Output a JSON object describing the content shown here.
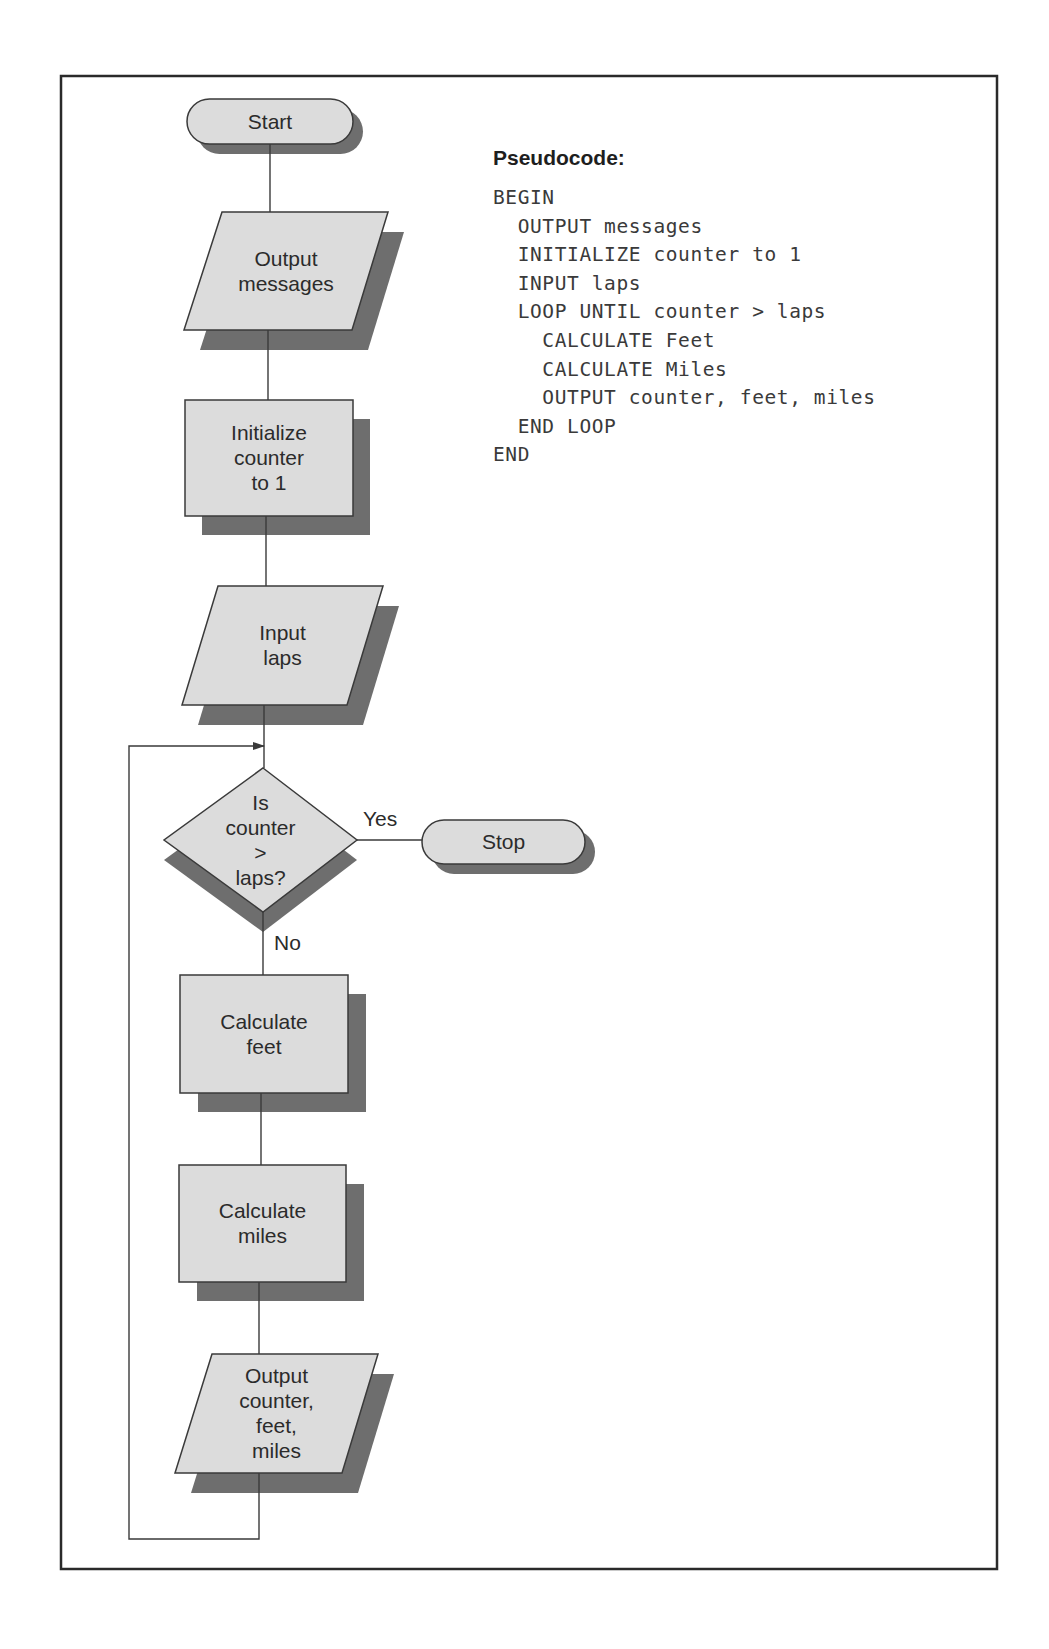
{
  "frame": {
    "x": 61,
    "y": 76,
    "width": 936,
    "height": 1493
  },
  "colors": {
    "shape_fill": "#dcdcdc",
    "shadow": "#6e6e6e",
    "stroke": "#3a3a3a",
    "frame": "#2a2a2a"
  },
  "flowchart": {
    "nodes": [
      {
        "id": "start",
        "type": "terminator",
        "label_lines": [
          "Start"
        ],
        "x": 187,
        "y": 99,
        "width": 166,
        "height": 45,
        "shadow_dx": 10,
        "shadow_dy": 10
      },
      {
        "id": "output-messages",
        "type": "io",
        "label_lines": [
          "Output",
          "messages"
        ],
        "points": [
          [
            222,
            212
          ],
          [
            388,
            212
          ],
          [
            352,
            330
          ],
          [
            184,
            330
          ]
        ],
        "shadow_dx": 16,
        "shadow_dy": 20
      },
      {
        "id": "initialize-counter",
        "type": "process",
        "label_lines": [
          "Initialize",
          "counter",
          "to 1"
        ],
        "x": 185,
        "y": 400,
        "width": 168,
        "height": 116,
        "shadow_dx": 17,
        "shadow_dy": 19
      },
      {
        "id": "input-laps",
        "type": "io",
        "label_lines": [
          "Input",
          "laps"
        ],
        "points": [
          [
            218,
            586
          ],
          [
            383,
            586
          ],
          [
            347,
            705
          ],
          [
            182,
            705
          ]
        ],
        "shadow_dx": 16,
        "shadow_dy": 20
      },
      {
        "id": "decision-counter-gt-laps",
        "type": "decision",
        "label_lines": [
          "Is",
          "counter",
          ">",
          "laps?"
        ],
        "points": [
          [
            263,
            768
          ],
          [
            357,
            840
          ],
          [
            263,
            912
          ],
          [
            164,
            840
          ]
        ],
        "shadow_dx": 0,
        "shadow_dy": 20
      },
      {
        "id": "stop",
        "type": "terminator",
        "label_lines": [
          "Stop"
        ],
        "x": 422,
        "y": 820,
        "width": 163,
        "height": 44,
        "shadow_dx": 10,
        "shadow_dy": 10
      },
      {
        "id": "calculate-feet",
        "type": "process",
        "label_lines": [
          "Calculate",
          "feet"
        ],
        "x": 180,
        "y": 975,
        "width": 168,
        "height": 118,
        "shadow_dx": 18,
        "shadow_dy": 19
      },
      {
        "id": "calculate-miles",
        "type": "process",
        "label_lines": [
          "Calculate",
          "miles"
        ],
        "x": 179,
        "y": 1165,
        "width": 167,
        "height": 117,
        "shadow_dx": 18,
        "shadow_dy": 19
      },
      {
        "id": "output-counter-feet-miles",
        "type": "io",
        "label_lines": [
          "Output",
          "counter,",
          "feet,",
          "miles"
        ],
        "points": [
          [
            212,
            1354
          ],
          [
            378,
            1354
          ],
          [
            342,
            1473
          ],
          [
            175,
            1473
          ]
        ],
        "shadow_dx": 16,
        "shadow_dy": 20
      }
    ],
    "edges": [
      {
        "id": "start-to-output",
        "points": [
          [
            270,
            144
          ],
          [
            270,
            212
          ]
        ]
      },
      {
        "id": "output-to-init",
        "points": [
          [
            268,
            330
          ],
          [
            268,
            400
          ]
        ]
      },
      {
        "id": "init-to-input",
        "points": [
          [
            266,
            516
          ],
          [
            266,
            586
          ]
        ]
      },
      {
        "id": "input-to-decision",
        "points": [
          [
            264,
            705
          ],
          [
            264,
            768
          ]
        ]
      },
      {
        "id": "decision-yes-to-stop",
        "points": [
          [
            357,
            840
          ],
          [
            422,
            840
          ]
        ],
        "label": "Yes",
        "label_x": 363,
        "label_y": 826
      },
      {
        "id": "decision-no-to-feet",
        "points": [
          [
            263,
            912
          ],
          [
            263,
            975
          ]
        ],
        "label": "No",
        "label_x": 274,
        "label_y": 950
      },
      {
        "id": "feet-to-miles",
        "points": [
          [
            261,
            1093
          ],
          [
            261,
            1165
          ]
        ]
      },
      {
        "id": "miles-to-output",
        "points": [
          [
            259,
            1282
          ],
          [
            259,
            1354
          ]
        ]
      },
      {
        "id": "loop-back",
        "points": [
          [
            259,
            1473
          ],
          [
            259,
            1539
          ],
          [
            129,
            1539
          ],
          [
            129,
            746
          ],
          [
            264,
            746
          ]
        ],
        "arrow": true
      }
    ]
  },
  "pseudocode": {
    "title": "Pseudocode:",
    "title_x": 493,
    "title_y": 146,
    "body_x": 493,
    "body_y": 184,
    "lines": [
      "BEGIN",
      "  OUTPUT messages",
      "  INITIALIZE counter to 1",
      "  INPUT laps",
      "  LOOP UNTIL counter > laps",
      "    CALCULATE Feet",
      "    CALCULATE Miles",
      "    OUTPUT counter, feet, miles",
      "  END LOOP",
      "END"
    ]
  }
}
